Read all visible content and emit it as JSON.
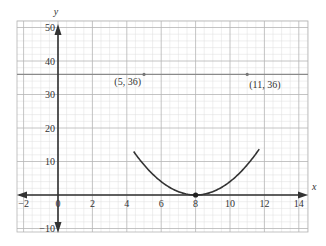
{
  "chart_data": {
    "type": "line",
    "title": "",
    "xlabel": "x",
    "ylabel": "y",
    "xlim": [
      -2.4,
      14.5
    ],
    "ylim": [
      -11,
      52
    ],
    "grid": true,
    "x_ticks": [
      -2,
      0,
      2,
      4,
      6,
      8,
      10,
      12,
      14
    ],
    "x_tick_labels": [
      "−2",
      "0",
      "2",
      "4",
      "6",
      "8",
      "10",
      "12",
      "14"
    ],
    "y_ticks": [
      -10,
      10,
      20,
      30,
      40,
      50
    ],
    "y_tick_labels": [
      "−10",
      "10",
      "20",
      "30",
      "40",
      "50"
    ],
    "series": [
      {
        "name": "y = (x − 8)²",
        "kind": "curve",
        "equation": "(x-8)^2",
        "x_range": [
          4.4,
          11.7
        ]
      },
      {
        "name": "y = 36",
        "kind": "horizontal_line",
        "y": 36
      }
    ],
    "points": [
      {
        "x": 5,
        "y": 36,
        "label": "(5, 36)"
      },
      {
        "x": 11,
        "y": 36,
        "label": "(11, 36)"
      },
      {
        "x": 8,
        "y": 0,
        "label": ""
      }
    ]
  },
  "colors": {
    "grid_major": "#b5b5b5",
    "grid_minor": "#dedede",
    "axis": "#333333",
    "curve": "#333333",
    "hline": "#8a8a8a"
  }
}
